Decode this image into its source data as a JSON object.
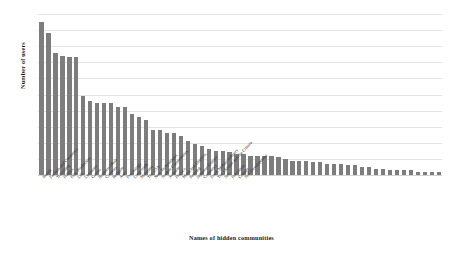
{
  "chart_data": {
    "type": "bar",
    "title": "",
    "xlabel": "Names of hidden communities",
    "ylabel": "Number of users",
    "ylim": [
      0,
      100
    ],
    "ytick_step": 10,
    "yticks": [
      0,
      10,
      20,
      30,
      40,
      50,
      60,
      70,
      80,
      90,
      100
    ],
    "grid": true,
    "legend": false,
    "bar_color": "#7d7d7d",
    "grid_color": "#e3e3e3",
    "categories": [
      "Health",
      "Fashion and Cosmetics",
      "Travelling",
      "Politics",
      "Film Production",
      "Life",
      "Literature",
      "Games",
      "Business Ideas",
      "Contests",
      "Religion",
      "Auto",
      "Psychology",
      "Long-reads",
      "Museums",
      "The USA",
      "New Technologies",
      "Student Communities",
      "Aviation",
      "Physics",
      "Municipal Districts",
      "Knitting",
      "Japanese Culture",
      "Cosmetics",
      "Food, Mobile Industry",
      "The Ukraine and the Crimea",
      "Sex",
      "Patriotism",
      "Collage",
      "Self-Development"
    ],
    "values": [
      95,
      88,
      76,
      74,
      73,
      73,
      49,
      46,
      45,
      45,
      45,
      42,
      42,
      38,
      36,
      34,
      28,
      28,
      26,
      26,
      24,
      21,
      19,
      18,
      16,
      15,
      15,
      14,
      13,
      13
    ],
    "tail_values": [
      12,
      12,
      12,
      12,
      11,
      10,
      9,
      9,
      9,
      8,
      8,
      7,
      7,
      7,
      6,
      6,
      5,
      5,
      4,
      4,
      3,
      3,
      3,
      3,
      2,
      2,
      2,
      2
    ]
  }
}
